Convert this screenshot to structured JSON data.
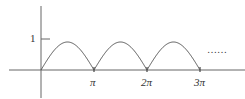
{
  "chart_data": {
    "type": "line",
    "title": "",
    "function": "|sin x|",
    "xlabel": "",
    "ylabel": "",
    "x_ticks": [
      "π",
      "2π",
      "3π"
    ],
    "y_ticks": [
      "1"
    ],
    "x": [
      0,
      0.785,
      1.571,
      2.356,
      3.142,
      3.927,
      4.712,
      5.498,
      6.283,
      7.069,
      7.854,
      8.639,
      9.425
    ],
    "values": [
      0,
      0.707,
      1,
      0.707,
      0,
      0.707,
      1,
      0.707,
      0,
      0.707,
      1,
      0.707,
      0
    ],
    "ylim": [
      0,
      1
    ],
    "annotation": "……",
    "grid": false
  },
  "labels": {
    "y_one": "1",
    "pi": "π",
    "two_pi": "2π",
    "three_pi": "3π",
    "dots": "……"
  },
  "colors": {
    "axis": "#555555",
    "curve": "#555555"
  }
}
